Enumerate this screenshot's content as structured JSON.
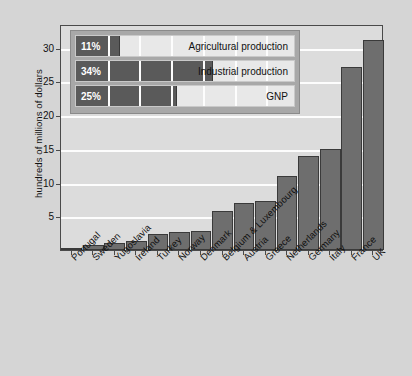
{
  "chart_data": {
    "type": "bar",
    "title": "",
    "xlabel": "",
    "ylabel": "hundreds of millions of dollars",
    "ylim": [
      0,
      33.5
    ],
    "yticks": [
      5,
      10,
      15,
      20,
      25,
      30
    ],
    "grid": true,
    "categories": [
      "Portugal",
      "Sweden",
      "Yugoslavia",
      "Ireland",
      "Turkey",
      "Norway",
      "Denmark",
      "Belgium & Luxembourg",
      "Austria",
      "Greece",
      "Netherlands",
      "Germany",
      "Italy",
      "France",
      "UK"
    ],
    "values": [
      0.2,
      0.7,
      1.0,
      1.3,
      2.3,
      2.7,
      2.8,
      5.8,
      6.9,
      7.2,
      11.0,
      14.0,
      15.0,
      27.2,
      31.2
    ],
    "bar_color": "#6e6e6e",
    "plot_background": "#dcdcdc",
    "gridline_color": "#fdfdfd",
    "page_background": "#d5d5d5",
    "legend_position": "inset-top-left",
    "legend": {
      "rows": [
        {
          "percent": "11%",
          "label": "Agricultural production",
          "value": 11
        },
        {
          "percent": "34%",
          "label": "Industrial production",
          "value": 34
        },
        {
          "percent": "25%",
          "label": "GNP",
          "value": 25
        }
      ],
      "scale_max": 55
    }
  },
  "axis": {
    "y_title": "hundreds of millions of dollars",
    "tick_labels": [
      "30",
      "25",
      "20",
      "15",
      "10",
      "5"
    ]
  }
}
